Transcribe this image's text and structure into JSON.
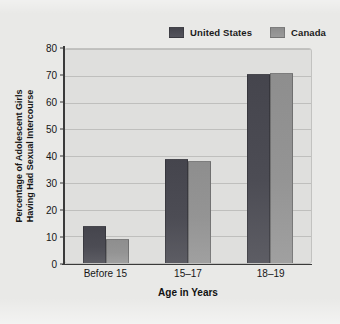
{
  "chart_data": {
    "type": "bar",
    "title": "",
    "categories": [
      "Before 15",
      "15–17",
      "18–19"
    ],
    "series": [
      {
        "name": "United States",
        "values": [
          14,
          39,
          70.5
        ],
        "color": "#4c4c54"
      },
      {
        "name": "Canada",
        "values": [
          9,
          38,
          71
        ],
        "color": "#949494"
      }
    ],
    "xlabel": "Age in Years",
    "ylabel": "Percentage of Adolescent Girls Having Had Sexual Intercourse",
    "ylabel_line1": "Percentage of Adolescent Girls",
    "ylabel_line2": "Having Had Sexual Intercourse",
    "ylim": [
      0,
      80
    ],
    "yticks": [
      80,
      70,
      60,
      50,
      40,
      30,
      20,
      10,
      0
    ],
    "ytick_labels": [
      "80",
      "70",
      "60",
      "50",
      "40",
      "30",
      "20",
      "10",
      "0"
    ],
    "grid": true,
    "grid_axis": "y",
    "legend_position": "top-right",
    "plot_background": "#dfdfdd",
    "figure_background": "#e9e9e7"
  },
  "legend": {
    "items": [
      {
        "label": "United States",
        "swatch": "legend-swatch-united-states"
      },
      {
        "label": "Canada",
        "swatch": "legend-swatch-canada"
      }
    ]
  }
}
